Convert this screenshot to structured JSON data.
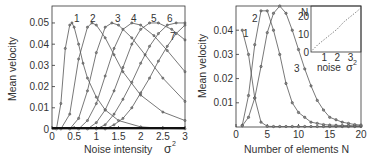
{
  "chart_data": [
    {
      "type": "line",
      "title": "",
      "xlabel": "Noise intensity",
      "xlabel_symbol": "σ²",
      "ylabel": "Mean velocity",
      "xlim": [
        0,
        3
      ],
      "ylim": [
        0,
        0.058
      ],
      "xticks": [
        "0",
        "0.5",
        "1",
        "1.5",
        "2",
        "2.5",
        "3"
      ],
      "yticks": [
        "0",
        "0.01",
        "0.02",
        "0.03",
        "0.04",
        "0.05"
      ],
      "grid": false,
      "series": [
        {
          "name": "1",
          "x": [
            0.1,
            0.2,
            0.3,
            0.4,
            0.45,
            0.5,
            0.6,
            0.7,
            0.8,
            1.0,
            1.2,
            1.5,
            2.0,
            2.5,
            3.0
          ],
          "values": [
            0.0,
            0.012,
            0.038,
            0.049,
            0.05,
            0.048,
            0.04,
            0.031,
            0.024,
            0.015,
            0.009,
            0.004,
            0.001,
            0.0003,
            0.0001
          ]
        },
        {
          "name": "2",
          "x": [
            0.2,
            0.4,
            0.6,
            0.8,
            0.9,
            1.0,
            1.2,
            1.4,
            1.6,
            2.0,
            2.5,
            3.0
          ],
          "values": [
            0.0,
            0.007,
            0.033,
            0.048,
            0.05,
            0.049,
            0.043,
            0.035,
            0.027,
            0.016,
            0.008,
            0.004
          ]
        },
        {
          "name": "3",
          "x": [
            0.4,
            0.6,
            0.8,
            1.0,
            1.2,
            1.35,
            1.5,
            1.8,
            2.1,
            2.5,
            3.0
          ],
          "values": [
            0.0,
            0.005,
            0.018,
            0.036,
            0.048,
            0.05,
            0.049,
            0.043,
            0.035,
            0.024,
            0.013
          ]
        },
        {
          "name": "4",
          "x": [
            0.6,
            0.8,
            1.0,
            1.2,
            1.4,
            1.6,
            1.8,
            2.0,
            2.3,
            2.6,
            3.0
          ],
          "values": [
            0.0,
            0.004,
            0.012,
            0.025,
            0.038,
            0.047,
            0.05,
            0.049,
            0.044,
            0.037,
            0.027
          ]
        },
        {
          "name": "5",
          "x": [
            0.8,
            1.0,
            1.2,
            1.4,
            1.6,
            1.8,
            2.0,
            2.2,
            2.4,
            2.7,
            3.0
          ],
          "values": [
            0.0,
            0.003,
            0.009,
            0.018,
            0.029,
            0.04,
            0.047,
            0.05,
            0.05,
            0.047,
            0.042
          ]
        },
        {
          "name": "6",
          "x": [
            1.0,
            1.2,
            1.4,
            1.6,
            1.8,
            2.0,
            2.2,
            2.4,
            2.6,
            2.8,
            3.0
          ],
          "values": [
            0.0,
            0.002,
            0.007,
            0.014,
            0.022,
            0.031,
            0.039,
            0.045,
            0.049,
            0.05,
            0.05
          ]
        },
        {
          "name": "7",
          "x": [
            1.2,
            1.4,
            1.6,
            1.8,
            2.0,
            2.2,
            2.4,
            2.6,
            2.8,
            3.0
          ],
          "values": [
            0.0,
            0.002,
            0.005,
            0.01,
            0.017,
            0.024,
            0.032,
            0.039,
            0.045,
            0.049
          ]
        }
      ],
      "annotations": [
        "1",
        "2",
        "3",
        "4",
        "5",
        "6",
        "7"
      ]
    },
    {
      "type": "line",
      "title": "",
      "xlabel": "Number of elements",
      "xlabel_symbol": "N",
      "ylabel": "Mean velocity",
      "xlim": [
        0,
        20
      ],
      "ylim": [
        0,
        0.05
      ],
      "xticks": [
        "0",
        "5",
        "10",
        "15",
        "20"
      ],
      "yticks": [
        "0.01",
        "0.02",
        "0.03",
        "0.04"
      ],
      "grid": false,
      "series": [
        {
          "name": "1",
          "x": [
            1,
            2,
            3,
            4,
            5,
            6,
            7,
            8,
            9,
            10,
            11,
            12,
            13,
            14,
            15,
            16,
            17,
            18,
            19,
            20
          ],
          "values": [
            0.04,
            0.03,
            0.012,
            0.002,
            0.0003,
            0.0002,
            0.0002,
            0.0002,
            0.0002,
            0.0002,
            0.0002,
            0.0002,
            0.0002,
            0.0002,
            0.0002,
            0.0002,
            0.0002,
            0.0002,
            0.0002,
            0.0002
          ]
        },
        {
          "name": "2",
          "x": [
            1,
            2,
            3,
            4,
            5,
            6,
            7,
            8,
            9,
            10,
            11,
            12,
            13,
            14,
            15,
            16,
            17,
            18,
            19,
            20
          ],
          "values": [
            0.0007,
            0.013,
            0.034,
            0.048,
            0.048,
            0.04,
            0.03,
            0.018,
            0.01,
            0.006,
            0.004,
            0.002,
            0.0015,
            0.001,
            0.0008,
            0.0007,
            0.0006,
            0.0006,
            0.0005,
            0.0005
          ]
        },
        {
          "name": "3",
          "x": [
            1,
            2,
            3,
            4,
            5,
            6,
            7,
            8,
            9,
            10,
            11,
            12,
            13,
            14,
            15,
            16,
            17,
            18,
            19,
            20
          ],
          "values": [
            0.0005,
            0.004,
            0.012,
            0.025,
            0.039,
            0.047,
            0.05,
            0.047,
            0.04,
            0.032,
            0.024,
            0.017,
            0.011,
            0.007,
            0.004,
            0.003,
            0.002,
            0.0015,
            0.001,
            0.0008
          ]
        }
      ],
      "annotations": [
        "1",
        "2",
        "3"
      ],
      "inset": {
        "type": "line",
        "xlabel": "noise",
        "xlabel_symbol": "σ²",
        "ylabel": "N",
        "xticks": [
          "1",
          "2",
          "3"
        ],
        "yticks": [
          "0",
          "10",
          "20"
        ],
        "xlim": [
          0,
          3.8
        ],
        "ylim": [
          0,
          26
        ],
        "x": [
          0.1,
          0.5,
          1.0,
          1.5,
          2.0,
          2.5,
          3.0,
          3.5,
          3.8
        ],
        "values": [
          1,
          4,
          7,
          10,
          13,
          17,
          20,
          23,
          25
        ]
      }
    }
  ],
  "labels": {
    "left_ylabel": "Mean velocity",
    "left_xlabel": "Noise intensity",
    "left_xsym": "σ",
    "sup2": "2",
    "right_ylabel": "Mean velocity",
    "right_xlabel": "Number of elements  N",
    "inset_ylabel": "N",
    "inset_xlabel": "noise",
    "inset_xsym": "σ"
  }
}
